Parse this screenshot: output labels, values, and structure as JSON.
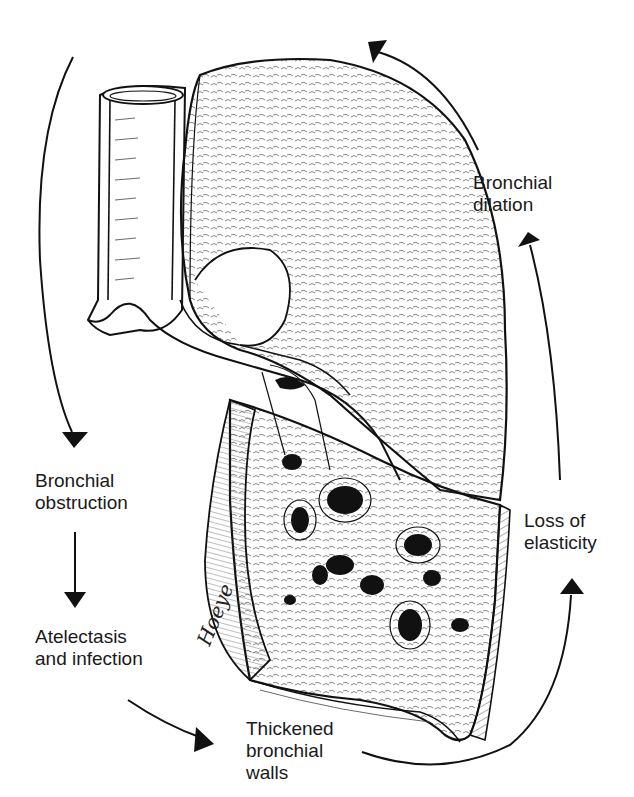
{
  "diagram": {
    "stroke_color": "#111111",
    "background": "#ffffff",
    "signature": "Hoeye",
    "labels": [
      {
        "id": "bronchial-dilation",
        "lines": [
          "Bronchial",
          "dilation"
        ]
      },
      {
        "id": "bronchial-obstruction",
        "lines": [
          "Bronchial",
          "obstruction"
        ]
      },
      {
        "id": "atelectasis-infection",
        "lines": [
          "Atelectasis",
          "and infection"
        ]
      },
      {
        "id": "thickened-walls",
        "lines": [
          "Thickened",
          "bronchial",
          "walls"
        ]
      },
      {
        "id": "loss-elasticity",
        "lines": [
          "Loss of",
          "elasticity"
        ]
      }
    ],
    "cycle_order": [
      "Bronchial obstruction",
      "Atelectasis and infection",
      "Thickened bronchial walls",
      "Loss of elasticity",
      "Bronchial dilation"
    ]
  }
}
